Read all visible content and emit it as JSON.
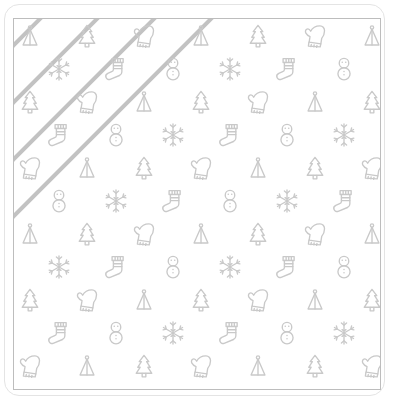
{
  "artwork": {
    "title": "Winter holiday diagonal stripe pattern tile",
    "background_color": "#ffffff",
    "stripe_color": "#c2c2c2",
    "icon_color": "#c9c9c9",
    "frame_color": "#bdbdbd",
    "outer_border_color": "#e4e4e4"
  },
  "frame": {
    "outer": {
      "x": 4,
      "y": 4,
      "width": 381,
      "height": 392,
      "radius": 15
    },
    "inner": {
      "x": 13,
      "y": 18,
      "width": 368,
      "height": 372
    }
  },
  "stripes": {
    "angle_deg": -45,
    "thickness": 3.6,
    "spacing": 57,
    "count": 13,
    "offsets": [
      -230,
      -173,
      -116,
      -59,
      -2,
      55,
      112,
      169,
      226,
      283,
      340,
      397,
      454
    ]
  },
  "icon_names": [
    "cone-tree-icon",
    "fir-tree-icon",
    "mitten-icon",
    "snowflake-icon",
    "stocking-icon",
    "snowman-icon"
  ],
  "grid": {
    "col_spacing": 57,
    "row_spacing": 33,
    "row_offset": 28.5,
    "first_col_x": 16,
    "first_row_y": 17
  },
  "rows": [
    {
      "offset": false,
      "icons": [
        "cone-tree-icon",
        "fir-tree-icon",
        "mitten-icon",
        "cone-tree-icon",
        "fir-tree-icon",
        "mitten-icon",
        "cone-tree-icon"
      ]
    },
    {
      "offset": true,
      "icons": [
        "snowflake-icon",
        "stocking-icon",
        "snowman-icon",
        "snowflake-icon",
        "stocking-icon",
        "snowman-icon"
      ]
    },
    {
      "offset": false,
      "icons": [
        "fir-tree-icon",
        "mitten-icon",
        "cone-tree-icon",
        "fir-tree-icon",
        "mitten-icon",
        "cone-tree-icon",
        "fir-tree-icon"
      ]
    },
    {
      "offset": true,
      "icons": [
        "stocking-icon",
        "snowman-icon",
        "snowflake-icon",
        "stocking-icon",
        "snowman-icon",
        "snowflake-icon"
      ]
    },
    {
      "offset": false,
      "icons": [
        "mitten-icon",
        "cone-tree-icon",
        "fir-tree-icon",
        "mitten-icon",
        "cone-tree-icon",
        "fir-tree-icon",
        "mitten-icon"
      ]
    },
    {
      "offset": true,
      "icons": [
        "snowman-icon",
        "snowflake-icon",
        "stocking-icon",
        "snowman-icon",
        "snowflake-icon",
        "stocking-icon"
      ]
    },
    {
      "offset": false,
      "icons": [
        "cone-tree-icon",
        "fir-tree-icon",
        "mitten-icon",
        "cone-tree-icon",
        "fir-tree-icon",
        "mitten-icon",
        "cone-tree-icon"
      ]
    },
    {
      "offset": true,
      "icons": [
        "snowflake-icon",
        "stocking-icon",
        "snowman-icon",
        "snowflake-icon",
        "stocking-icon",
        "snowman-icon"
      ]
    },
    {
      "offset": false,
      "icons": [
        "fir-tree-icon",
        "mitten-icon",
        "cone-tree-icon",
        "fir-tree-icon",
        "mitten-icon",
        "cone-tree-icon",
        "fir-tree-icon"
      ]
    },
    {
      "offset": true,
      "icons": [
        "stocking-icon",
        "snowman-icon",
        "snowflake-icon",
        "stocking-icon",
        "snowman-icon",
        "snowflake-icon"
      ]
    },
    {
      "offset": false,
      "icons": [
        "mitten-icon",
        "cone-tree-icon",
        "fir-tree-icon",
        "mitten-icon",
        "cone-tree-icon",
        "fir-tree-icon",
        "mitten-icon"
      ]
    }
  ]
}
